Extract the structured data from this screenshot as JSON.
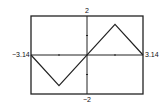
{
  "chart_data": {
    "type": "line",
    "title": "",
    "xlabel": "",
    "ylabel": "",
    "x": [
      -3.14,
      -1.57,
      1.57,
      3.14
    ],
    "series": [
      {
        "name": "f(x)",
        "values": [
          0,
          -1.57,
          1.57,
          0
        ]
      }
    ],
    "xlim": [
      -3.14,
      3.14
    ],
    "ylim": [
      -2,
      2
    ],
    "tick_labels": {
      "x_min": "-3.14",
      "x_max": "3.14",
      "y_max": "2",
      "y_min": "-2"
    },
    "grid": false,
    "legend": "none",
    "axes_through_origin": true,
    "x_ticks": [
      -1.57,
      1.57
    ],
    "y_ticks": [
      -1,
      1
    ]
  },
  "labels": {
    "x_min": "−3.14",
    "x_max": "3.14",
    "y_max": "2",
    "y_min": "−2"
  }
}
